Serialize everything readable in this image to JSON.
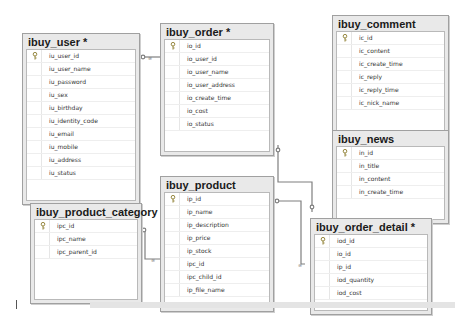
{
  "diagram": {
    "tables": [
      {
        "id": "ibuy_user",
        "title": "ibuy_user *",
        "key_column": "iu_user_id",
        "columns": [
          "iu_user_id",
          "iu_user_name",
          "iu_password",
          "iu_sex",
          "iu_birthday",
          "iu_identity_code",
          "iu_email",
          "iu_mobile",
          "iu_address",
          "iu_status"
        ]
      },
      {
        "id": "ibuy_order",
        "title": "ibuy_order *",
        "key_column": "io_id",
        "columns": [
          "io_id",
          "io_user_id",
          "io_user_name",
          "io_user_address",
          "io_create_time",
          "io_cost",
          "io_status"
        ]
      },
      {
        "id": "ibuy_comment",
        "title": "ibuy_comment",
        "key_column": "ic_id",
        "columns": [
          "ic_id",
          "ic_content",
          "ic_create_time",
          "ic_reply",
          "ic_reply_time",
          "ic_nick_name"
        ]
      },
      {
        "id": "ibuy_news",
        "title": "ibuy_news",
        "key_column": "in_id",
        "columns": [
          "in_id",
          "in_title",
          "in_content",
          "in_create_time"
        ]
      },
      {
        "id": "ibuy_product",
        "title": "ibuy_product",
        "key_column": "ip_id",
        "columns": [
          "ip_id",
          "ip_name",
          "ip_description",
          "ip_price",
          "ip_stock",
          "ipc_id",
          "ipc_child_id",
          "ip_file_name"
        ]
      },
      {
        "id": "ibuy_product_category",
        "title": "ibuy_product_category",
        "key_column": "ipc_id",
        "columns": [
          "ipc_id",
          "ipc_name",
          "ipc_parent_id"
        ]
      },
      {
        "id": "ibuy_order_detail",
        "title": "ibuy_order_detail *",
        "key_column": "iod_id",
        "columns": [
          "iod_id",
          "io_id",
          "ip_id",
          "iod_quantity",
          "iod_cost"
        ]
      }
    ],
    "relationships": [
      {
        "from": "ibuy_user",
        "to": "ibuy_order",
        "one_end": "key",
        "many_end": "infinity"
      },
      {
        "from": "ibuy_order",
        "to": "ibuy_order_detail",
        "one_end": "key",
        "many_end": "infinity"
      },
      {
        "from": "ibuy_product",
        "to": "ibuy_order_detail",
        "one_end": "key",
        "many_end": "infinity"
      },
      {
        "from": "ibuy_product_category",
        "to": "ibuy_product",
        "one_end": "key",
        "many_end": "infinity"
      }
    ],
    "colors": {
      "line": "#7f7f7f",
      "header_bg": "#e9e9e9",
      "border": "#a0a0a0"
    }
  }
}
